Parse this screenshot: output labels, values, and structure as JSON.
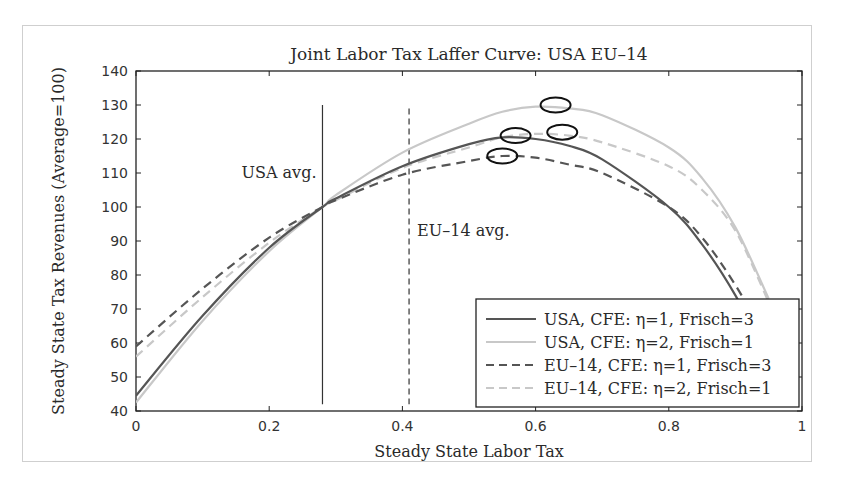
{
  "chart_data": {
    "type": "line",
    "title": "Joint Labor Tax Laffer Curve: USA EU–14",
    "xlabel": "Steady State Labor Tax",
    "ylabel": "Steady State Tax Revenues (Average=100)",
    "xlim": [
      0,
      1
    ],
    "ylim": [
      40,
      140
    ],
    "xticks": [
      "0",
      "0.2",
      "0.4",
      "0.6",
      "0.8",
      "1"
    ],
    "yticks": [
      "40",
      "50",
      "60",
      "70",
      "80",
      "90",
      "100",
      "110",
      "120",
      "130",
      "140"
    ],
    "grid": false,
    "legend_position": "lower right",
    "annotations": [
      {
        "text": "USA avg.",
        "x_line": 0.28,
        "style": "solid vertical line"
      },
      {
        "text": "EU–14 avg.",
        "x_line": 0.41,
        "style": "dashed vertical line"
      }
    ],
    "peak_markers": [
      {
        "series": "USA, CFE: η=2, Frisch=1",
        "x": 0.63,
        "y": 130
      },
      {
        "series": "USA, CFE: η=1, Frisch=3",
        "x": 0.57,
        "y": 121
      },
      {
        "series": "EU–14, CFE: η=2, Frisch=1",
        "x": 0.64,
        "y": 122
      },
      {
        "series": "EU–14, CFE: η=1, Frisch=3",
        "x": 0.55,
        "y": 115
      }
    ],
    "x": [
      0,
      0.1,
      0.2,
      0.28,
      0.3,
      0.4,
      0.5,
      0.55,
      0.6,
      0.65,
      0.7,
      0.8,
      0.85,
      0.9,
      0.95
    ],
    "series": [
      {
        "name": "USA, CFE: η=1, Frisch=3",
        "color": "#555555",
        "dash": "solid",
        "values": [
          44.5,
          68,
          88,
          100,
          102.5,
          112,
          118.5,
          120.5,
          120,
          118,
          114,
          100,
          89,
          74,
          55
        ]
      },
      {
        "name": "USA, CFE: η=2, Frisch=1",
        "color": "#c8c8c8",
        "dash": "solid",
        "values": [
          42.5,
          66.5,
          87,
          100,
          103.5,
          116,
          124.5,
          128,
          129.5,
          129,
          127,
          117.5,
          108.5,
          94,
          73
        ]
      },
      {
        "name": "EU–14, CFE: η=1, Frisch=3",
        "color": "#555555",
        "dash": "dashed",
        "values": [
          59,
          76,
          91,
          100,
          102,
          109.5,
          113.5,
          115,
          114.5,
          112.5,
          110,
          100,
          91,
          77,
          60
        ]
      },
      {
        "name": "EU–14, CFE: η=2, Frisch=1",
        "color": "#c8c8c8",
        "dash": "dashed",
        "values": [
          56,
          73.5,
          89.5,
          100,
          102,
          111.5,
          117.5,
          120.5,
          121.5,
          121,
          119,
          112,
          105,
          93,
          72
        ]
      }
    ]
  },
  "caption_partial": "Figure continues below (text cut off)"
}
